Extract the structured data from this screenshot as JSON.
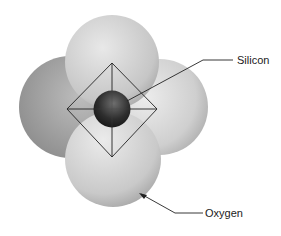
{
  "diagram": {
    "type": "silica tetrahedron",
    "labels": {
      "silicon": "Silicon",
      "oxygen": "Oxygen"
    },
    "colors": {
      "oxygen_light": "#e6e6e6",
      "oxygen_dark": "#9a9a9a",
      "silicon_light": "#6a6a6a",
      "silicon_dark": "#1a1a1a",
      "lines": "#222222"
    }
  }
}
